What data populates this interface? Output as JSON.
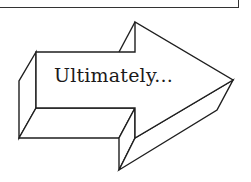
{
  "diagram": {
    "type": "3d-arrow",
    "direction": "right",
    "label": "Ultimately...",
    "colors": {
      "stroke": "#1f1f1f",
      "fill": "#ffffff",
      "text": "#1a1a1a",
      "box_border": "#333333"
    }
  }
}
